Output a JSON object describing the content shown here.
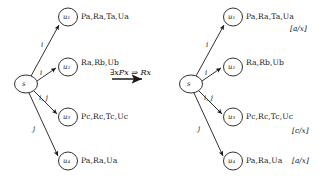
{
  "figure": {
    "transformation": {
      "formula": "∃xPx ⇒ Rx",
      "arrow_icon": "thick-right-arrow"
    },
    "left_graph": {
      "name": "left-model",
      "root": {
        "id": "s-left",
        "label": "s"
      },
      "nodes": [
        {
          "id": "u1",
          "label": "u₁",
          "atoms": "Pa,Ra,Ta,Ua",
          "substitution": ""
        },
        {
          "id": "u2",
          "label": "u₂",
          "atoms": "Ra,Rb,Ub",
          "substitution": ""
        },
        {
          "id": "u3",
          "label": "u₃",
          "atoms": "Pc,Rc,Tc,Uc",
          "substitution": ""
        },
        {
          "id": "u4",
          "label": "u₄",
          "atoms": "Pa,Ra,Ua",
          "substitution": ""
        }
      ],
      "edges": [
        {
          "from": "s",
          "to": "u1",
          "label": "i"
        },
        {
          "from": "s",
          "to": "u2",
          "label": "i"
        },
        {
          "from": "s",
          "to": "u3",
          "label": "i, j"
        },
        {
          "from": "s",
          "to": "u4",
          "label": "j"
        }
      ]
    },
    "right_graph": {
      "name": "right-model",
      "root": {
        "id": "s-right",
        "label": "s"
      },
      "nodes": [
        {
          "id": "u1",
          "label": "u₁",
          "atoms": "Pa,Ra,Ta,Ua",
          "substitution": "[a/x]"
        },
        {
          "id": "u2",
          "label": "u₂",
          "atoms": "Ra,Rb,Ub",
          "substitution": ""
        },
        {
          "id": "u3",
          "label": "u₃",
          "atoms": "Pc,Rc,Tc,Uc",
          "substitution": "[c/x]"
        },
        {
          "id": "u4",
          "label": "u₄",
          "atoms": "Pa,Ra,Ua",
          "substitution": "[a/x]"
        }
      ],
      "edges": [
        {
          "from": "s",
          "to": "u1",
          "label": "i"
        },
        {
          "from": "s",
          "to": "u2",
          "label": "i"
        },
        {
          "from": "s",
          "to": "u3",
          "label": "i, j"
        },
        {
          "from": "s",
          "to": "u4",
          "label": "j"
        }
      ]
    },
    "colors": {
      "stroke": "#1a1a1a",
      "text": "#151515",
      "background": "#ffffff"
    }
  }
}
